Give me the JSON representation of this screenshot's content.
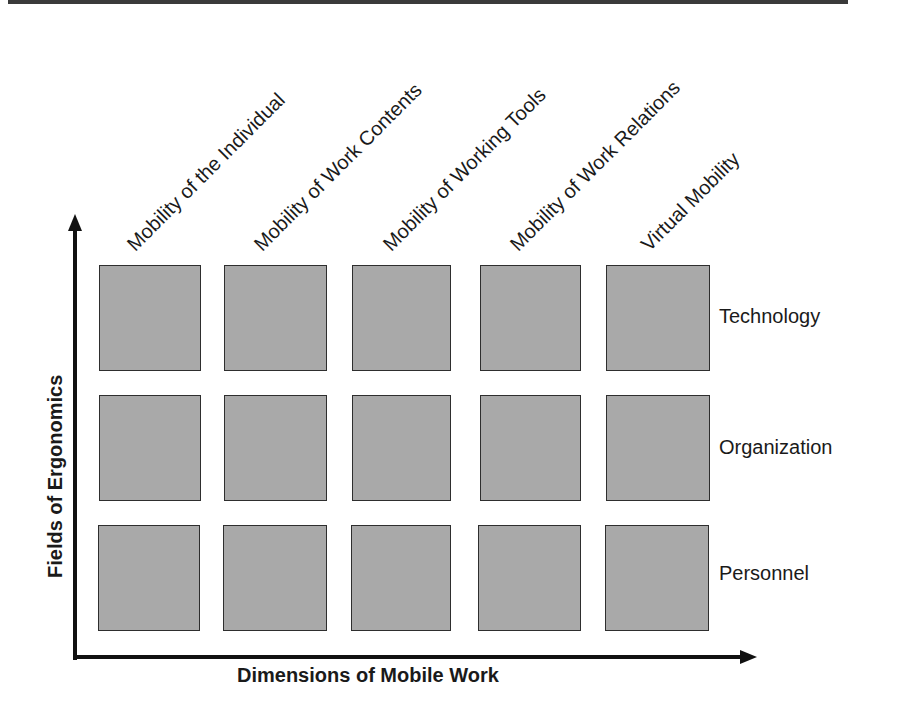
{
  "diagram": {
    "columns": [
      {
        "label": "Mobility of the Individual"
      },
      {
        "label": "Mobility of Work Contents"
      },
      {
        "label": "Mobility of Working Tools"
      },
      {
        "label": "Mobility of Work Relations"
      },
      {
        "label": "Virtual Mobility"
      }
    ],
    "rows": [
      {
        "label": "Technology"
      },
      {
        "label": "Organization"
      },
      {
        "label": "Personnel"
      }
    ],
    "axes": {
      "x_label": "Dimensions of Mobile Work",
      "y_label": "Fields of Ergonomics"
    },
    "colors": {
      "cell_fill": "#a9a9a9",
      "cell_border": "#2e2e2e",
      "axis": "#111111",
      "text": "#1a1a1a"
    }
  }
}
